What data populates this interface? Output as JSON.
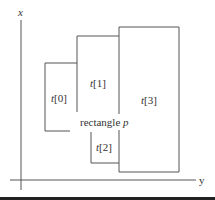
{
  "diagram": {
    "axes": {
      "vertical_label": "x",
      "horizontal_label": "y"
    },
    "rectangles": [
      {
        "id": "t0",
        "var": "t",
        "index": "[0]"
      },
      {
        "id": "t1",
        "var": "t",
        "index": "[1]"
      },
      {
        "id": "t2",
        "var": "t",
        "index": "[2]"
      },
      {
        "id": "t3",
        "var": "t",
        "index": "[3]"
      }
    ],
    "query_rect": {
      "label_prefix": "rectangle ",
      "label_var": "p"
    },
    "colors": {
      "stroke": "#555555",
      "text": "#333333",
      "background": "#ffffff",
      "bar": "#222222"
    }
  }
}
